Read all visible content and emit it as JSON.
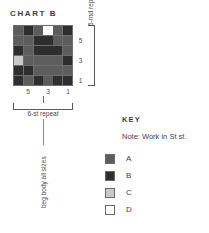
{
  "chart": {
    "title": "CHART B",
    "row_numbers": [
      "5",
      "3",
      "1"
    ],
    "col_numbers": [
      "5",
      "3",
      "1"
    ],
    "round_repeat_label": "6-rnd repeat",
    "stitch_repeat_label": "6-st repeat",
    "beg_body_label": "beg body all sizes"
  },
  "key": {
    "heading": "KEY",
    "note": "Note: Work in St st.",
    "entries": [
      {
        "label": "A",
        "color": "#5d5d5d"
      },
      {
        "label": "B",
        "color": "#2e2e2e"
      },
      {
        "label": "C",
        "color": "#c9c9c9"
      },
      {
        "label": "D",
        "color": "#ffffff"
      }
    ]
  },
  "chart_data": {
    "type": "heatmap",
    "title": "CHART B",
    "xlabel": "",
    "ylabel": "",
    "grid": true,
    "rows": 6,
    "cols": 6,
    "legend_position": "right",
    "categories_x": [
      "6",
      "5",
      "4",
      "3",
      "2",
      "1"
    ],
    "categories_y": [
      "6",
      "5",
      "4",
      "3",
      "2",
      "1"
    ],
    "tick_labels_x": [
      "5",
      "3",
      "1"
    ],
    "tick_labels_y": [
      "5",
      "3",
      "1"
    ],
    "value_colors": {
      "A": "#5d5d5d",
      "B": "#2e2e2e",
      "C": "#c9c9c9",
      "D": "#ffffff"
    },
    "cells": [
      [
        "A",
        "B",
        "A",
        "D",
        "A",
        "B"
      ],
      [
        "A",
        "A",
        "B",
        "B",
        "A",
        "A"
      ],
      [
        "B",
        "A",
        "B",
        "B",
        "B",
        "A"
      ],
      [
        "C",
        "A",
        "A",
        "A",
        "A",
        "B"
      ],
      [
        "B",
        "B",
        "A",
        "A",
        "A",
        "A"
      ],
      [
        "B",
        "A",
        "B",
        "A",
        "B",
        "B"
      ]
    ],
    "annotations": [
      "6-rnd repeat",
      "6-st repeat",
      "beg body all sizes",
      "Note: Work in St st."
    ]
  }
}
